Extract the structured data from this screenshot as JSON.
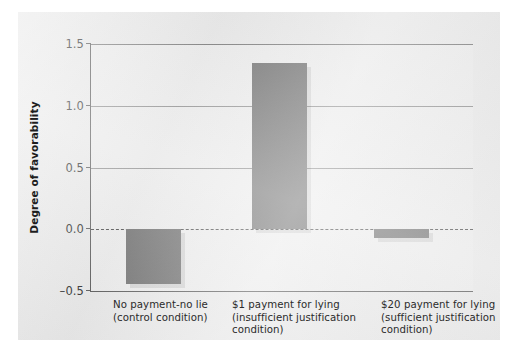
{
  "chart_data": {
    "type": "bar",
    "title": "",
    "subtitle": "",
    "xlabel": "",
    "ylabel": "Degree of favorability",
    "ylim": [
      -0.5,
      1.5
    ],
    "yticks": [
      "1.5",
      "1.0",
      "0.5",
      "0.0",
      "-0.5"
    ],
    "ytick_values": [
      1.5,
      1.0,
      0.5,
      0.0,
      -0.5
    ],
    "grid": "horizontal",
    "legend": "none",
    "zero_reference_line": "dashed at 0.0",
    "categories": [
      "No payment-no lie (control condition)",
      "$1 payment for lying (insufficient justification condition)",
      "$20 payment for lying (sufficient justification condition)"
    ],
    "category_lines": [
      [
        "No payment-no lie",
        "(control condition)"
      ],
      [
        "$1 payment for lying",
        "(insufficient justification",
        "condition)"
      ],
      [
        "$20 payment for lying",
        "(sufficient justification",
        "condition)"
      ]
    ],
    "values": [
      -0.44,
      1.35,
      -0.07
    ],
    "bar_color": "#6e6e6e",
    "panel_color": "#e9e9e9",
    "plot_color": "#ececec",
    "axis_color": "#585858",
    "grid_color": "#8f8f8f"
  }
}
